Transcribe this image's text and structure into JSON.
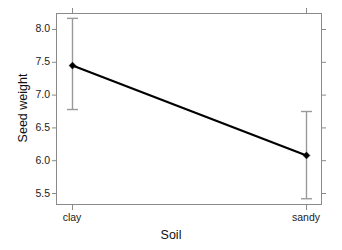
{
  "chart_data": {
    "type": "line",
    "title": "",
    "subtitle": "",
    "xlabel": "Soil",
    "ylabel": "Seed weight",
    "categories": [
      "clay",
      "sandy"
    ],
    "x_tick_labels": [
      "clay",
      "sandy"
    ],
    "y_tick_labels": [
      "5.5",
      "6.0",
      "6.5",
      "7.0",
      "7.5",
      "8.0"
    ],
    "y_ticks": [
      5.5,
      6.0,
      6.5,
      7.0,
      7.5,
      8.0
    ],
    "ylim": [
      5.32,
      8.25
    ],
    "grid": false,
    "legend": false,
    "legend_position": "none",
    "series": [
      {
        "name": "mean seed weight",
        "values": [
          7.45,
          6.08
        ],
        "error_upper": [
          8.17,
          6.75
        ],
        "error_lower": [
          6.78,
          5.42
        ],
        "marker": "diamond",
        "line_color": "#000000",
        "error_bar_color": "#9a9a9a"
      }
    ],
    "points": [
      {
        "category": "clay",
        "value": 7.45,
        "ci_low": 6.78,
        "ci_high": 8.17
      },
      {
        "category": "sandy",
        "value": 6.08,
        "ci_low": 5.42,
        "ci_high": 6.75
      }
    ],
    "colors": {
      "line": "#000000",
      "marker": "#000000",
      "error_bar": "#9a9a9a",
      "frame": "#8a8a8a",
      "tick": "#8a8a8a",
      "text": "#111111",
      "background": "#ffffff"
    }
  },
  "axes": {
    "y_title": "Seed weight",
    "x_title": "Soil",
    "y_labels": {
      "t0": "5.5",
      "t1": "6.0",
      "t2": "6.5",
      "t3": "7.0",
      "t4": "7.5",
      "t5": "8.0"
    },
    "x_labels": {
      "c0": "clay",
      "c1": "sandy"
    }
  }
}
